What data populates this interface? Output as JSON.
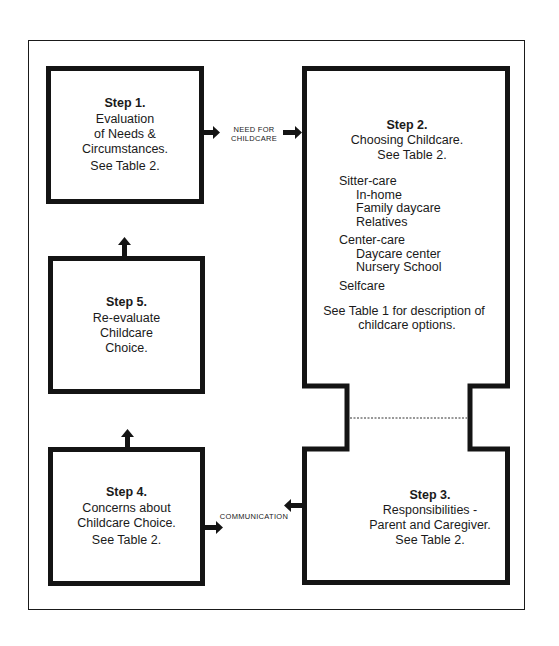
{
  "diagram": {
    "type": "flowchart",
    "steps": [
      {
        "id": "step1",
        "title": "Step 1.",
        "lines": [
          "Evaluation",
          "of Needs &",
          "Circumstances.",
          "See Table 2."
        ]
      },
      {
        "id": "step2",
        "title": "Step 2.",
        "lines": [
          "Choosing Childcare.",
          "See Table 2."
        ],
        "options": [
          {
            "category": "Sitter-care",
            "items": [
              "In-home",
              "Family daycare",
              "Relatives"
            ]
          },
          {
            "category": "Center-care",
            "items": [
              "Daycare center",
              "Nursery School"
            ]
          },
          {
            "category": "Selfcare",
            "items": []
          }
        ],
        "footnote": [
          "See Table 1 for description of",
          "childcare options."
        ]
      },
      {
        "id": "step3",
        "title": "Step 3.",
        "lines": [
          "Responsibilities -",
          "Parent and Caregiver.",
          "See Table 2."
        ]
      },
      {
        "id": "step4",
        "title": "Step 4.",
        "lines": [
          "Concerns about",
          "Childcare Choice.",
          "See Table 2."
        ]
      },
      {
        "id": "step5",
        "title": "Step 5.",
        "lines": [
          "Re-evaluate",
          "Childcare",
          "Choice."
        ]
      }
    ],
    "connectors": [
      {
        "from": "step1",
        "to": "step2",
        "label": [
          "NEED FOR",
          "CHILDCARE"
        ]
      },
      {
        "from": "step3",
        "to": "step4",
        "label": [
          "COMMUNICATION"
        ],
        "bidirectional": true
      },
      {
        "from": "step4",
        "to": "step5",
        "label": []
      },
      {
        "from": "step5",
        "to": "step1",
        "label": []
      }
    ]
  }
}
